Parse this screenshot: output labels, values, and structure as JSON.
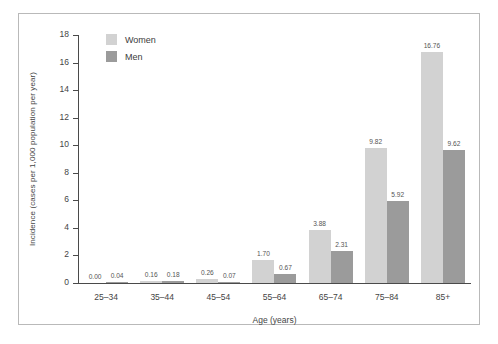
{
  "chart_data": {
    "type": "bar",
    "title": "",
    "xlabel": "Age (years)",
    "ylabel": "Incidence (cases per 1,000 population per year)",
    "categories": [
      "25–34",
      "35–44",
      "45–54",
      "55–64",
      "65–74",
      "75–84",
      "85+"
    ],
    "series": [
      {
        "name": "Women",
        "color": "#d2d2d2",
        "values": [
          0.0,
          0.16,
          0.26,
          1.7,
          3.88,
          9.82,
          16.76
        ],
        "labels": [
          "0.00",
          "0.16",
          "0.26",
          "1.70",
          "3.88",
          "9.82",
          "16.76"
        ]
      },
      {
        "name": "Men",
        "color": "#9b9b9b",
        "values": [
          0.04,
          0.18,
          0.07,
          0.67,
          2.31,
          5.92,
          9.62
        ],
        "labels": [
          "0.04",
          "0.18",
          "0.07",
          "0.67",
          "2.31",
          "5.92",
          "9.62"
        ]
      }
    ],
    "ylim": [
      0,
      18
    ],
    "yticks": [
      0,
      2,
      4,
      6,
      8,
      10,
      12,
      14,
      16,
      18
    ],
    "ytick_labels": [
      "0",
      "2",
      "4",
      "6",
      "8",
      "10",
      "12",
      "14",
      "16",
      "18"
    ],
    "grid": false,
    "legend_position": "top-left"
  }
}
